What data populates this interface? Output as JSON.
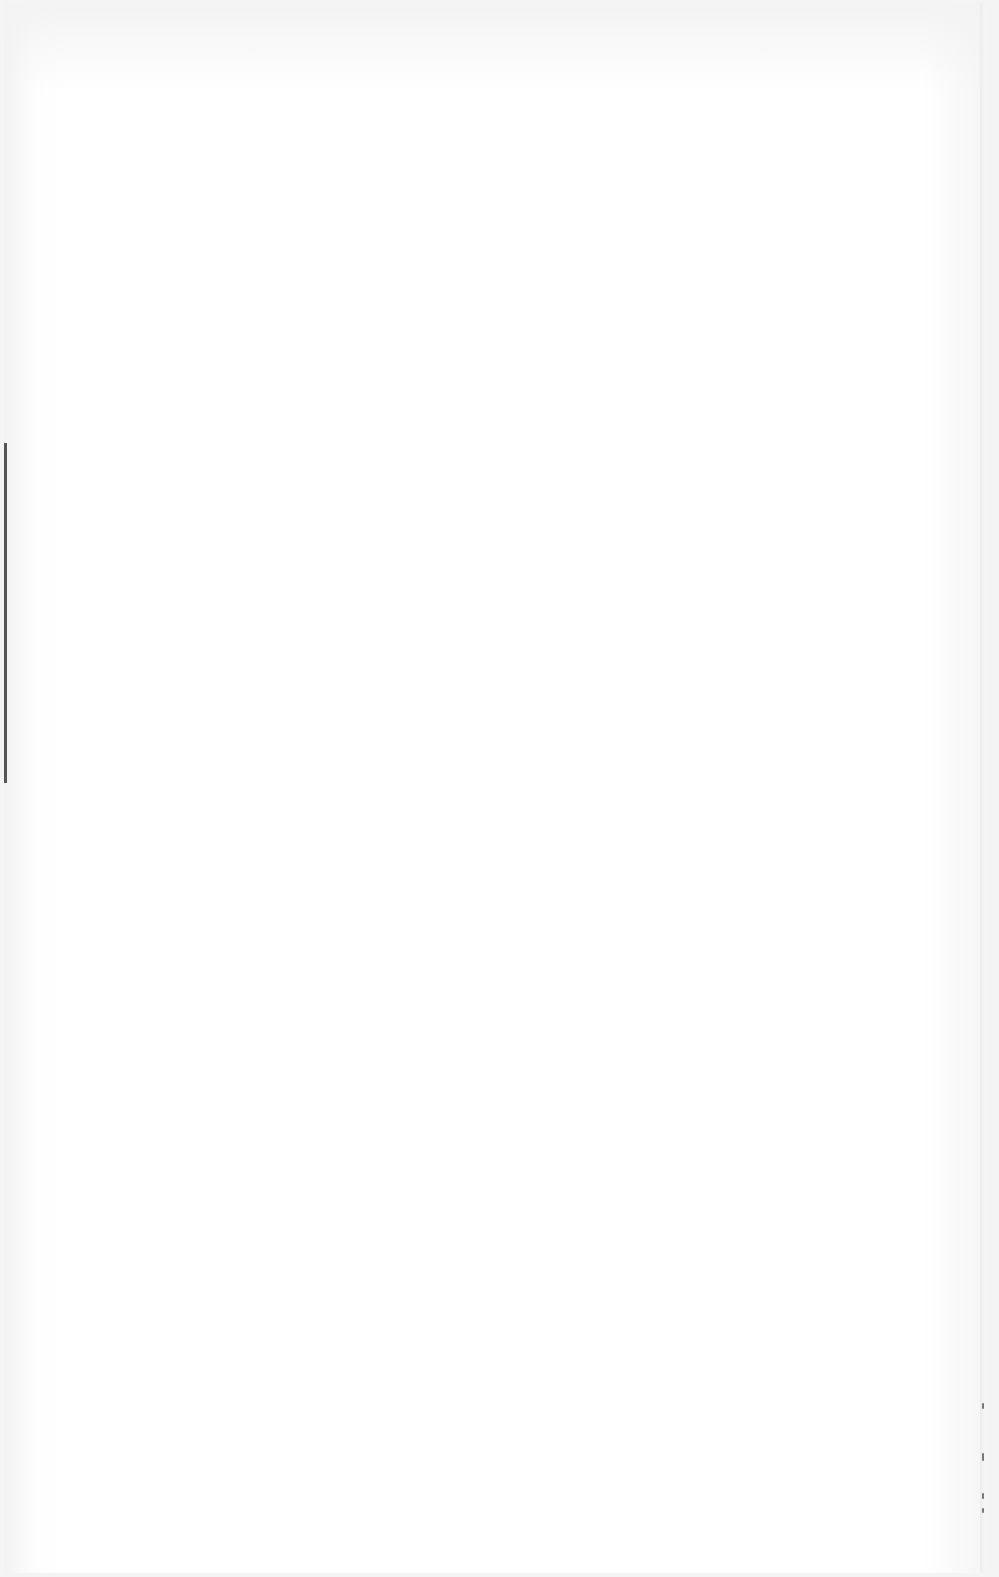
{
  "page": {
    "type": "blank-scanned-page",
    "text_content": ""
  }
}
